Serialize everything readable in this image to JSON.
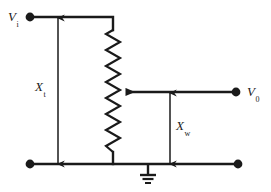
{
  "figure": {
    "kind": "circuit-diagram",
    "width": 271,
    "height": 192,
    "background_color": "#ffffff",
    "line_color": "#1a1a1a"
  },
  "labels": {
    "input_terminal": {
      "symbol": "V",
      "subscript": "i",
      "text": "Vi"
    },
    "output_terminal": {
      "symbol": "V",
      "subscript": "0",
      "text": "V0"
    },
    "total_reactance": {
      "symbol": "X",
      "subscript": "t",
      "text": "Xt"
    },
    "wiper_reactance": {
      "symbol": "X",
      "subscript": "w",
      "text": "Xw"
    }
  },
  "components": [
    {
      "name": "input-terminal-dot",
      "type": "terminal",
      "x": 30,
      "y": 17
    },
    {
      "name": "output-terminal-dot",
      "type": "terminal",
      "x": 236,
      "y": 92
    },
    {
      "name": "bottom-left-terminal-dot",
      "type": "terminal",
      "x": 30,
      "y": 164
    },
    {
      "name": "bottom-right-terminal-dot",
      "type": "terminal",
      "x": 238,
      "y": 164
    },
    {
      "name": "variable-resistor",
      "type": "zigzag-resistor",
      "x": 113,
      "y_top": 30,
      "y_bottom": 152,
      "zigs": 15
    },
    {
      "name": "wiper-arrow",
      "type": "arrow",
      "from_x": 236,
      "to_x": 121,
      "y": 92
    },
    {
      "name": "ground-symbol",
      "type": "ground",
      "x": 148,
      "y": 164
    },
    {
      "name": "total-reactance-dimension",
      "type": "double-arrow",
      "x": 58,
      "y_top": 18,
      "y_bottom": 163
    },
    {
      "name": "wiper-reactance-dimension",
      "type": "double-arrow",
      "x": 170,
      "y_top": 93,
      "y_bottom": 163
    }
  ]
}
